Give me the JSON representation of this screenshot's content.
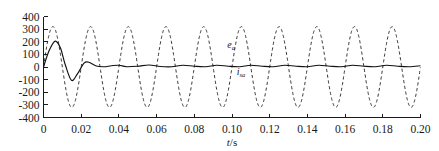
{
  "chart_data": {
    "type": "line",
    "title": "",
    "xlabel": "t/s",
    "ylabel": "",
    "xlim": [
      0,
      0.2
    ],
    "ylim": [
      -400,
      400
    ],
    "grid": false,
    "legend_position": "inline-annotation",
    "xticks": [
      0,
      0.02,
      0.04,
      0.06,
      0.08,
      0.1,
      0.12,
      0.14,
      0.16,
      0.18,
      0.2
    ],
    "xtick_labels": [
      "0",
      "0.02",
      "0.04",
      "0.06",
      "0.08",
      "0.10",
      "0.12",
      "0.14",
      "0.16",
      "0.18",
      "0.20"
    ],
    "yticks": [
      400,
      300,
      200,
      100,
      0,
      -100,
      -200,
      -300,
      -400
    ],
    "ytick_labels": [
      "400",
      "300",
      "200",
      "100",
      "0",
      "-100",
      "-200",
      "-300",
      "-400"
    ],
    "series": [
      {
        "name": "e_a",
        "label_main": "e",
        "label_sub": "a",
        "style": "dashed",
        "color": "#2a2a2a",
        "description": "grid phase voltage, sinusoidal steady state",
        "amplitude": 320,
        "frequency_hz": 50,
        "phase_deg": 0,
        "label_x": 0.0975,
        "label_y": 150
      },
      {
        "name": "i_sa",
        "label_main": "i",
        "label_sub": "sa",
        "style": "solid",
        "color": "#111111",
        "description": "phase current, damped transient settling to small ripple",
        "transient_peak": 205,
        "transient_trough": -105,
        "steady_ripple": 16,
        "label_x": 0.1025,
        "label_y": -60
      }
    ],
    "samples": {
      "note": "x in seconds; e_a = 320*sin(2*pi*50*t); i_sa = damped transient then small ripple around 0",
      "dashed_peaks_t": [
        0.005,
        0.025,
        0.045,
        0.065,
        0.085,
        0.105,
        0.125,
        0.145,
        0.165,
        0.185
      ],
      "dashed_peak_value": 320,
      "dashed_troughs_t": [
        0.015,
        0.035,
        0.055,
        0.075,
        0.095,
        0.115,
        0.135,
        0.155,
        0.175,
        0.195
      ],
      "dashed_trough_value": -320,
      "solid_key_points": [
        [
          0.0,
          0
        ],
        [
          0.003,
          130
        ],
        [
          0.0062,
          205
        ],
        [
          0.009,
          150
        ],
        [
          0.0115,
          20
        ],
        [
          0.0148,
          -105
        ],
        [
          0.018,
          -55
        ],
        [
          0.0215,
          30
        ],
        [
          0.024,
          38
        ],
        [
          0.028,
          8
        ],
        [
          0.032,
          2
        ],
        [
          0.036,
          10
        ],
        [
          0.04,
          14
        ],
        [
          0.044,
          2
        ],
        [
          0.05,
          6
        ],
        [
          0.056,
          16
        ],
        [
          0.062,
          4
        ],
        [
          0.068,
          2
        ],
        [
          0.074,
          14
        ],
        [
          0.08,
          6
        ],
        [
          0.086,
          2
        ],
        [
          0.092,
          14
        ],
        [
          0.098,
          6
        ],
        [
          0.104,
          2
        ],
        [
          0.11,
          14
        ],
        [
          0.116,
          6
        ],
        [
          0.122,
          2
        ],
        [
          0.128,
          14
        ],
        [
          0.134,
          6
        ],
        [
          0.14,
          2
        ],
        [
          0.146,
          14
        ],
        [
          0.152,
          6
        ],
        [
          0.158,
          2
        ],
        [
          0.164,
          14
        ],
        [
          0.17,
          6
        ],
        [
          0.176,
          2
        ],
        [
          0.182,
          14
        ],
        [
          0.188,
          6
        ],
        [
          0.194,
          2
        ],
        [
          0.2,
          10
        ]
      ]
    }
  }
}
